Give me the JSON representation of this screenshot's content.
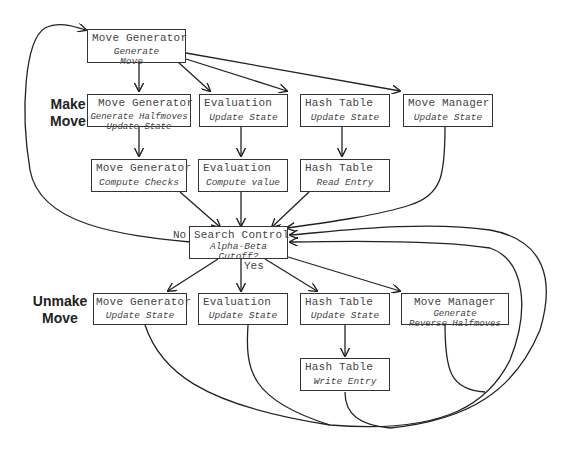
{
  "row_labels": {
    "make_move": [
      "Make",
      "Move"
    ],
    "unmake_move": [
      "Unmake",
      "Move"
    ]
  },
  "nodes": {
    "top_move_generator": {
      "title": "Move Generator",
      "lines": [
        "Generate",
        "Move"
      ]
    },
    "make_move_generator": {
      "title": "Move Generator",
      "lines": [
        "Generate Halfmoves",
        "Update State"
      ]
    },
    "make_evaluation": {
      "title": "Evaluation",
      "lines": [
        "Update State"
      ]
    },
    "make_hash_table": {
      "title": "Hash Table",
      "lines": [
        "Update State"
      ]
    },
    "make_move_manager": {
      "title": "Move Manager",
      "lines": [
        "Update State"
      ]
    },
    "checks_move_generator": {
      "title": "Move Generator",
      "lines": [
        "Compute Checks"
      ]
    },
    "value_evaluation": {
      "title": "Evaluation",
      "lines": [
        "Compute value"
      ]
    },
    "read_hash_table": {
      "title": "Hash Table",
      "lines": [
        "Read Entry"
      ]
    },
    "search_control": {
      "title": "Search Control",
      "lines": [
        "Alpha-Beta",
        "Cutoff?"
      ]
    },
    "unmake_move_generator": {
      "title": "Move Generator",
      "lines": [
        "Update State"
      ]
    },
    "unmake_evaluation": {
      "title": "Evaluation",
      "lines": [
        "Update State"
      ]
    },
    "unmake_hash_table": {
      "title": "Hash Table",
      "lines": [
        "Update State"
      ]
    },
    "unmake_move_manager": {
      "title": "Move Manager",
      "lines": [
        "Generate",
        "Reverse Halfmoves"
      ]
    },
    "write_hash_table": {
      "title": "Hash Table",
      "lines": [
        "Write Entry"
      ]
    }
  },
  "edge_labels": {
    "no": "No",
    "yes": "Yes"
  },
  "colors": {
    "stroke": "#222222",
    "text": "#444444",
    "background": "#ffffff"
  }
}
